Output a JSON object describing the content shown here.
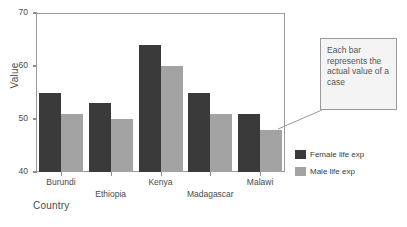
{
  "chart_data": {
    "type": "bar",
    "title": "",
    "xlabel": "Country",
    "ylabel": "Value",
    "categories": [
      "Burundi",
      "Ethiopia",
      "Kenya",
      "Madagascar",
      "Malawi"
    ],
    "series": [
      {
        "name": "Female life exp",
        "color": "#3a3a3a",
        "values": [
          55,
          53,
          64,
          55,
          51
        ]
      },
      {
        "name": "Male life exp",
        "color": "#a3a3a3",
        "values": [
          51,
          50,
          60,
          51,
          48
        ]
      }
    ],
    "ylim": [
      40,
      70
    ],
    "yticks": [
      40,
      50,
      60,
      70
    ],
    "grid": false,
    "legend_position": "right"
  },
  "annotation": {
    "text": "Each bar represents the actual value of a case",
    "border_color": "#9a9a9a",
    "fill_color": "#f4f4f4",
    "points_to": "Malawi male life exp bar"
  },
  "axis": {
    "ylabel": "Value",
    "xlabel": "Country",
    "tick_labels": [
      "70",
      "60",
      "50",
      "40"
    ]
  },
  "legend": {
    "items": [
      {
        "label": "Female life exp",
        "swatch": "legend-swatch-female"
      },
      {
        "label": "Male life exp",
        "swatch": "legend-swatch-male"
      }
    ]
  }
}
